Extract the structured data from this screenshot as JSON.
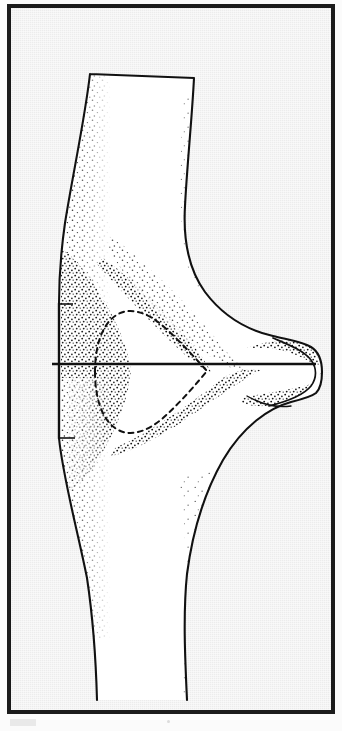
{
  "document": {
    "kind": "scanned-plate",
    "caption": "",
    "page_background_color": "#fbfbfb"
  },
  "plate": {
    "name": "anatomical-line-drawing-plate",
    "frame_color": "#1b1b1b",
    "frame_thickness_px": 4,
    "interior_background_color": "#ececec",
    "x": 7,
    "y": 4,
    "width": 328,
    "height": 710
  },
  "figure": {
    "title": "",
    "label": "",
    "ink_color": "#111111",
    "fill_color": "#ffffff",
    "stipple_color": "#1a1a1a",
    "parts": [
      {
        "name": "upper-shaft",
        "kind": "outline",
        "stroke": "#111111",
        "fill": "#ffffff"
      },
      {
        "name": "proximal-expansion",
        "kind": "outline",
        "stroke": "#111111",
        "fill": "#ffffff"
      },
      {
        "name": "lower-shaft",
        "kind": "outline",
        "stroke": "#111111",
        "fill": "#ffffff"
      },
      {
        "name": "posterior-process",
        "kind": "outline",
        "stroke": "#111111",
        "fill": "#ffffff"
      },
      {
        "name": "internal-cavity-dashed-outline",
        "kind": "dashed-outline",
        "stroke": "#111111"
      },
      {
        "name": "horizontal-reference-line",
        "kind": "measurement-line",
        "stroke": "#111111",
        "y": 363,
        "x_start": 48,
        "x_end": 312
      },
      {
        "name": "left-flange-edge",
        "kind": "straight-edge",
        "stroke": "#111111"
      },
      {
        "name": "stipple-shading",
        "kind": "texture",
        "stroke": "#1a1a1a"
      }
    ]
  },
  "artifacts": {
    "scan_smudge_color": "#e3e3e3",
    "scan_speck_color": "#dcdcdc"
  }
}
